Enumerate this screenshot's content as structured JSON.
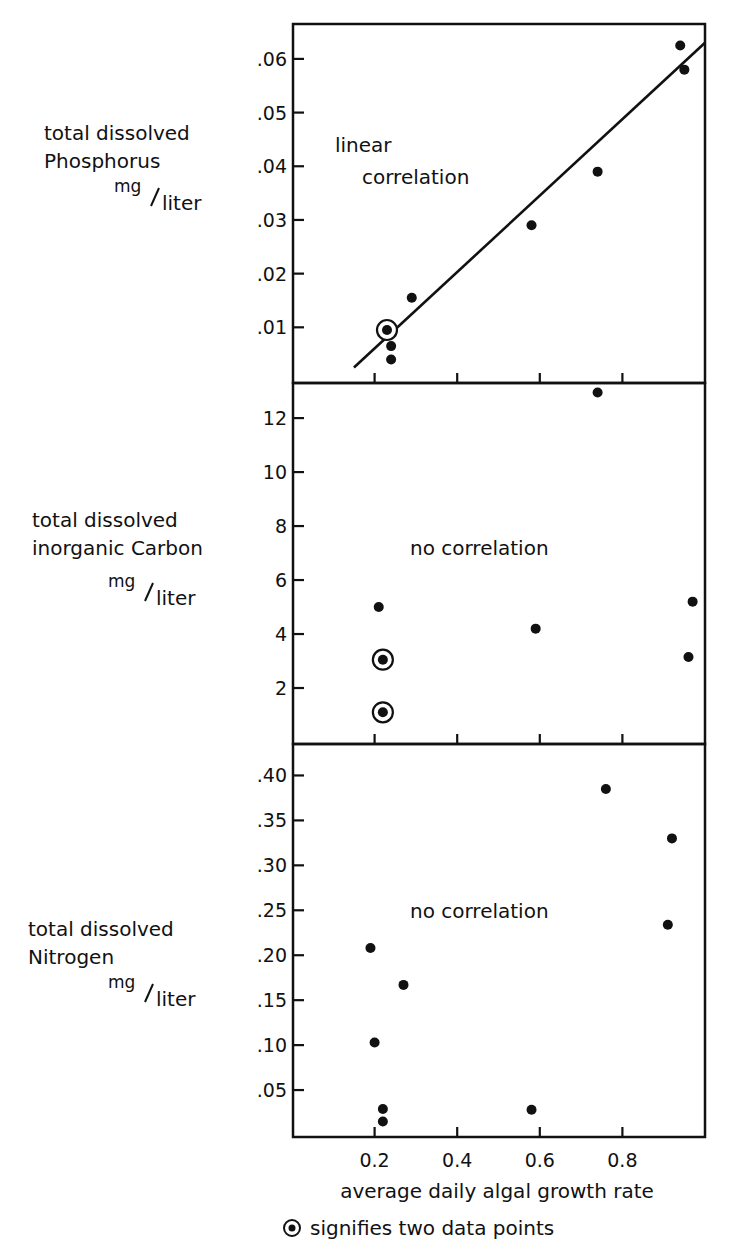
{
  "chart_data": [
    {
      "type": "scatter",
      "panel": "top",
      "ylabel_lines": [
        "total dissolved",
        "Phosphorus"
      ],
      "unit_num": "mg",
      "unit_den": "liter",
      "annotation_lines": [
        "linear",
        "correlation"
      ],
      "xlabel": "average daily algal growth rate",
      "xlim": [
        0,
        1.0
      ],
      "ylim": [
        0,
        0.0665
      ],
      "yticks": [
        0.01,
        0.02,
        0.03,
        0.04,
        0.05,
        0.06
      ],
      "ytick_labels": [
        ".01",
        ".02",
        ".03",
        ".04",
        ".05",
        ".06"
      ],
      "trendline": {
        "x": [
          0.15,
          1.0
        ],
        "y": [
          0.0025,
          0.063
        ]
      },
      "points": [
        {
          "x": 0.23,
          "y": 0.0095,
          "double": true
        },
        {
          "x": 0.24,
          "y": 0.0065,
          "double": false
        },
        {
          "x": 0.24,
          "y": 0.004,
          "double": false
        },
        {
          "x": 0.29,
          "y": 0.0155,
          "double": false
        },
        {
          "x": 0.58,
          "y": 0.029,
          "double": false
        },
        {
          "x": 0.74,
          "y": 0.039,
          "double": false
        },
        {
          "x": 0.94,
          "y": 0.0625,
          "double": false
        },
        {
          "x": 0.95,
          "y": 0.058,
          "double": false
        }
      ]
    },
    {
      "type": "scatter",
      "panel": "middle",
      "ylabel_lines": [
        "total dissolved",
        "inorganic Carbon"
      ],
      "unit_num": "mg",
      "unit_den": "liter",
      "annotation_lines": [
        "no correlation"
      ],
      "xlabel": "average daily algal growth rate",
      "xlim": [
        0,
        1.0
      ],
      "ylim": [
        0,
        13.3
      ],
      "yticks": [
        2,
        4,
        6,
        8,
        10,
        12
      ],
      "ytick_labels": [
        "2",
        "4",
        "6",
        "8",
        "10",
        "12"
      ],
      "points": [
        {
          "x": 0.74,
          "y": 12.95,
          "double": false
        },
        {
          "x": 0.21,
          "y": 5.0,
          "double": false
        },
        {
          "x": 0.59,
          "y": 4.2,
          "double": false
        },
        {
          "x": 0.97,
          "y": 5.2,
          "double": false
        },
        {
          "x": 0.96,
          "y": 3.15,
          "double": false
        },
        {
          "x": 0.22,
          "y": 3.05,
          "double": true
        },
        {
          "x": 0.22,
          "y": 1.1,
          "double": true
        }
      ]
    },
    {
      "type": "scatter",
      "panel": "bottom",
      "ylabel_lines": [
        "total dissolved",
        "Nitrogen"
      ],
      "unit_num": "mg",
      "unit_den": "liter",
      "annotation_lines": [
        "no correlation"
      ],
      "xlabel": "average daily algal growth rate",
      "xlim": [
        0,
        1.0
      ],
      "ylim": [
        0,
        0.435
      ],
      "yticks": [
        0.05,
        0.1,
        0.15,
        0.2,
        0.25,
        0.3,
        0.35,
        0.4
      ],
      "ytick_labels": [
        ".05",
        ".10",
        ".15",
        ".20",
        ".25",
        ".30",
        ".35",
        ".40"
      ],
      "xticks": [
        0.2,
        0.4,
        0.6,
        0.8
      ],
      "xtick_labels": [
        "0.2",
        "0.4",
        "0.6",
        "0.8"
      ],
      "points": [
        {
          "x": 0.76,
          "y": 0.385,
          "double": false
        },
        {
          "x": 0.92,
          "y": 0.33,
          "double": false
        },
        {
          "x": 0.91,
          "y": 0.234,
          "double": false
        },
        {
          "x": 0.19,
          "y": 0.208,
          "double": false
        },
        {
          "x": 0.27,
          "y": 0.167,
          "double": false
        },
        {
          "x": 0.2,
          "y": 0.103,
          "double": false
        },
        {
          "x": 0.22,
          "y": 0.029,
          "double": false
        },
        {
          "x": 0.22,
          "y": 0.015,
          "double": false
        },
        {
          "x": 0.58,
          "y": 0.028,
          "double": false
        }
      ]
    }
  ],
  "figure": {
    "xlabel": "average daily algal growth rate",
    "legend_text": "signifies two data points",
    "legend_symbol": "circled-dot",
    "ink_color": "#111111",
    "background": "#ffffff"
  }
}
